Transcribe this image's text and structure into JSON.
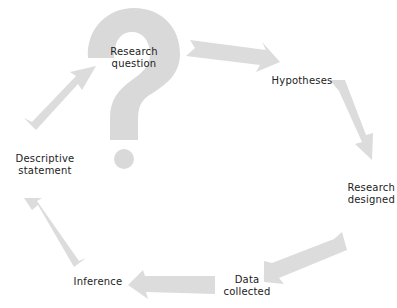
{
  "diagram": {
    "type": "research-cycle",
    "colors": {
      "shape_fill": "#d8d8d8",
      "text": "#222222",
      "background": "#ffffff"
    },
    "center_icon": "question-mark-icon",
    "nodes": [
      {
        "id": "research-question",
        "line1": "Research",
        "line2": "question"
      },
      {
        "id": "hypotheses",
        "line1": "Hypotheses"
      },
      {
        "id": "research-designed",
        "line1": "Research",
        "line2": "designed"
      },
      {
        "id": "data-collected",
        "line1": "Data",
        "line2": "collected"
      },
      {
        "id": "inference",
        "line1": "Inference"
      },
      {
        "id": "descriptive-statement",
        "line1": "Descriptive",
        "line2": "statement"
      }
    ],
    "edges": [
      {
        "from": "research-question",
        "to": "hypotheses"
      },
      {
        "from": "hypotheses",
        "to": "research-designed"
      },
      {
        "from": "research-designed",
        "to": "data-collected"
      },
      {
        "from": "data-collected",
        "to": "inference"
      },
      {
        "from": "inference",
        "to": "descriptive-statement"
      },
      {
        "from": "descriptive-statement",
        "to": "research-question"
      }
    ]
  }
}
